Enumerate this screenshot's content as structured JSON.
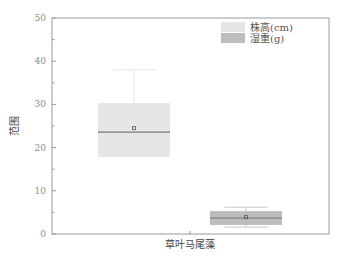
{
  "chart_data": {
    "type": "box",
    "title": "",
    "xlabel": "",
    "ylabel": "范围",
    "ylim": [
      0,
      50
    ],
    "yticks": [
      0,
      10,
      20,
      30,
      40,
      50
    ],
    "categories": [
      "草叶马尾藻"
    ],
    "grid": false,
    "legend_position": "top-right",
    "series": [
      {
        "name": "株高(cm)",
        "color": "#e6e6e6",
        "whisker_low": 18.0,
        "q1": 17.8,
        "median": 23.6,
        "mean": 24.5,
        "q3": 30.3,
        "whisker_high": 38.0
      },
      {
        "name": "湿重(g)",
        "color": "#bdbdbd",
        "whisker_low": 1.6,
        "q1": 2.1,
        "median": 3.7,
        "mean": 3.9,
        "q3": 5.3,
        "whisker_high": 6.2
      }
    ]
  },
  "labels": {
    "ylabel": "范围",
    "category": "草叶马尾藻",
    "legend": [
      "株高(cm)",
      "湿重(g)"
    ],
    "yticks": [
      "0",
      "10",
      "20",
      "30",
      "40",
      "50"
    ]
  }
}
